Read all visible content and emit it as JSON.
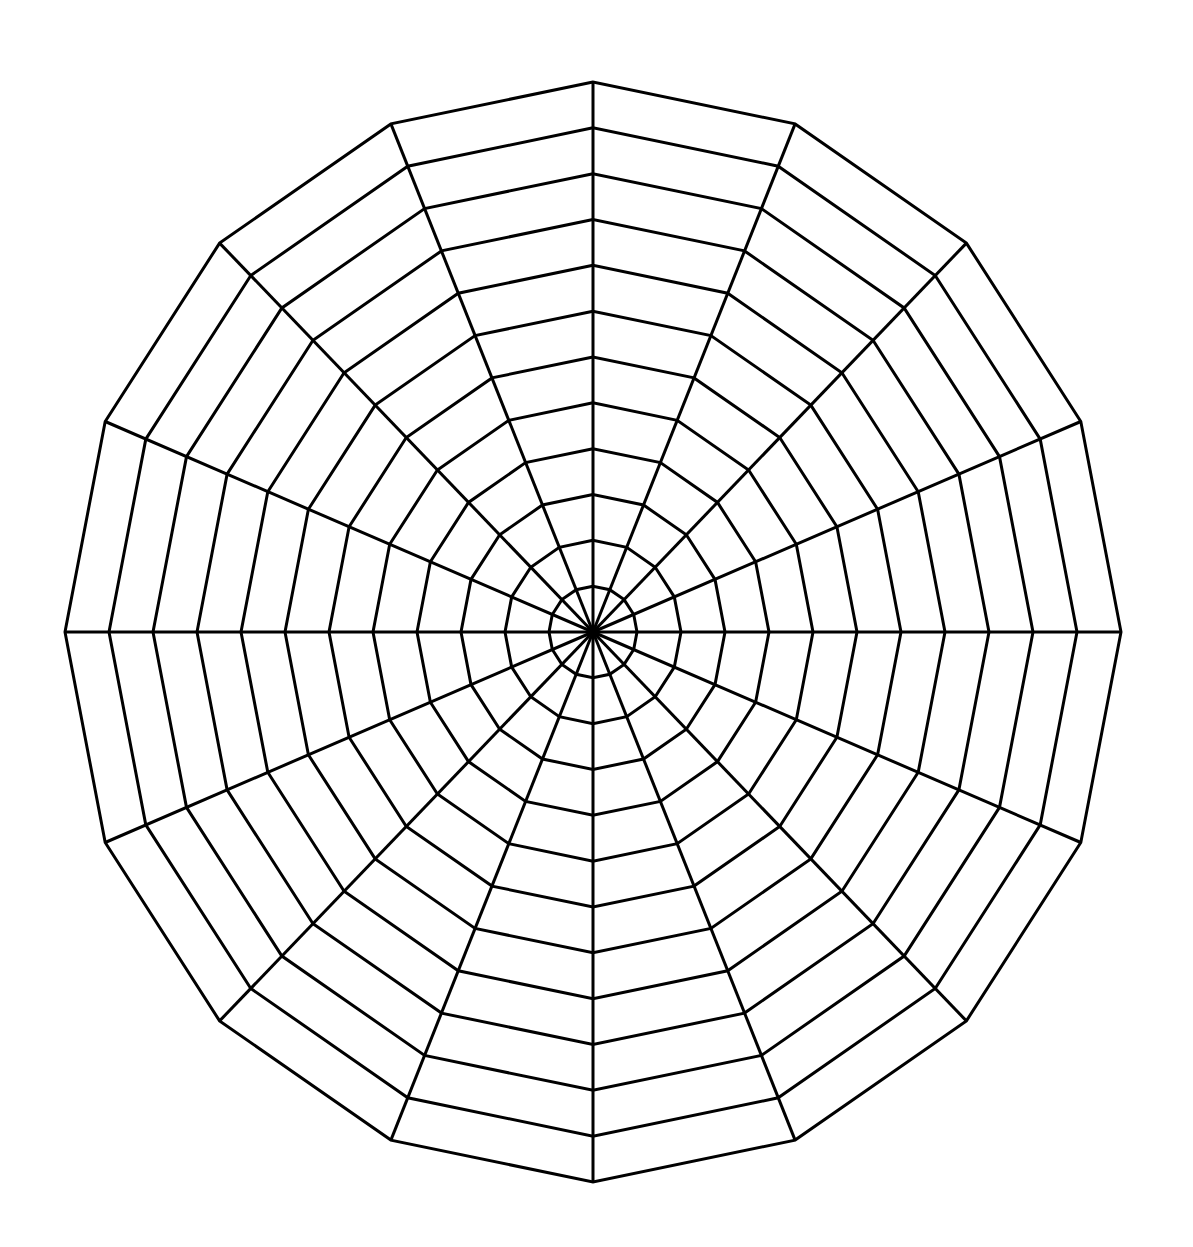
{
  "diagram": {
    "type": "polar-grid",
    "sides": 16,
    "spokes": 16,
    "rings": 12,
    "center": [
      593,
      632
    ],
    "radius_x": 528,
    "radius_y": 550,
    "rotation_deg": 90,
    "stroke_color": "#000000",
    "background_color": "#ffffff",
    "stroke_width": 3
  }
}
